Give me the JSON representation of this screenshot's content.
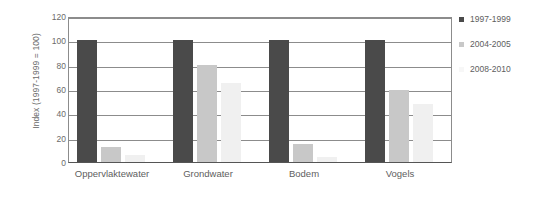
{
  "chart_data": {
    "type": "bar",
    "title": "",
    "subtitle": "",
    "xlabel": "",
    "ylabel": "Index (1997-1999 = 100)",
    "categories": [
      "Oppervlaktewater",
      "Grondwater",
      "Bodem",
      "Vogels"
    ],
    "series": [
      {
        "name": "1997-1999",
        "color": "#4a4a4a",
        "values": [
          100,
          100,
          100,
          100
        ]
      },
      {
        "name": "2004-2005",
        "color": "#c8c8c8",
        "values": [
          12,
          80,
          15,
          59
        ]
      },
      {
        "name": "2008-2010",
        "color": "#f0f0f0",
        "values": [
          6,
          65,
          4,
          48
        ]
      }
    ],
    "ylim": [
      0,
      120
    ],
    "yticks": [
      0,
      20,
      40,
      60,
      80,
      100,
      120
    ],
    "ytick_labels": [
      "0",
      "20",
      "40",
      "60",
      "80",
      "100",
      "120"
    ],
    "grid": "horizontal",
    "legend_position": "right"
  },
  "legend": {
    "items": [
      {
        "label": "1997-1999",
        "color": "#4a4a4a"
      },
      {
        "label": "2004-2005",
        "color": "#c8c8c8"
      },
      {
        "label": "2008-2010",
        "color": "#f7f7f7"
      }
    ]
  },
  "axes": {
    "y_title": "Index (1997-1999 = 100)"
  },
  "colors": {
    "gridline": "#8c8c8c",
    "axis": "#555555",
    "text": "#5e5e5e",
    "background": "#ffffff"
  }
}
